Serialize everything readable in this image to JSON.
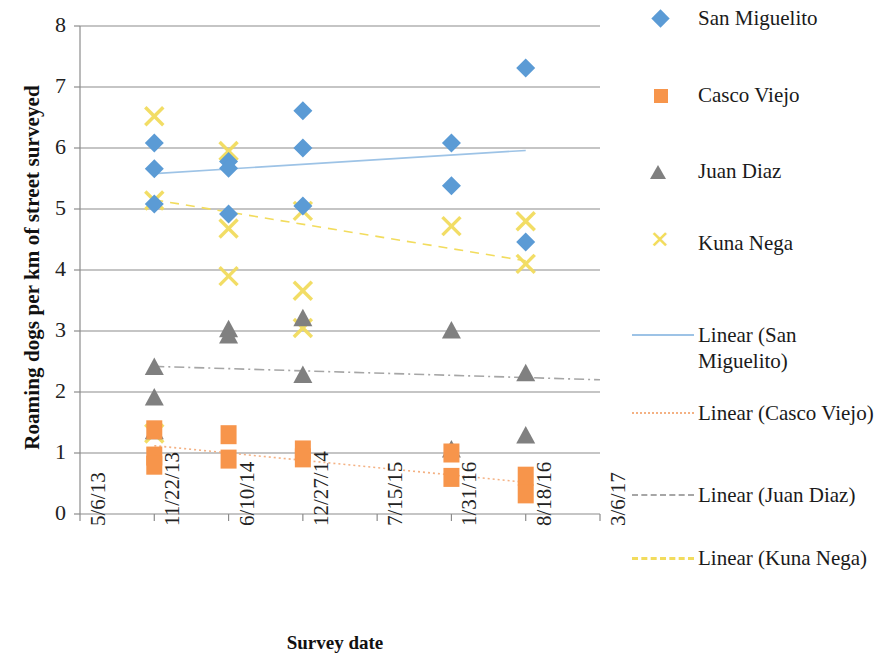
{
  "chart_data": {
    "type": "scatter",
    "title": "",
    "xlabel": "Survey date",
    "ylabel": "Roaming dogs per km of street surveyed",
    "ylim": [
      0,
      8
    ],
    "y_ticks": [
      0,
      1,
      2,
      3,
      4,
      5,
      6,
      7,
      8
    ],
    "x_ticks": [
      "5/6/13",
      "11/22/13",
      "6/10/14",
      "12/27/14",
      "7/15/15",
      "1/31/16",
      "8/18/16",
      "3/6/17"
    ],
    "grid": "horizontal",
    "legend_position": "right",
    "series": [
      {
        "name": "San Miguelito",
        "marker": "diamond",
        "color": "#5B9BD5",
        "points": [
          {
            "x": "11/22/13",
            "y": 6.08
          },
          {
            "x": "11/22/13",
            "y": 5.66
          },
          {
            "x": "11/22/13",
            "y": 5.08
          },
          {
            "x": "6/10/14",
            "y": 5.78
          },
          {
            "x": "6/10/14",
            "y": 5.67
          },
          {
            "x": "6/10/14",
            "y": 4.92
          },
          {
            "x": "12/27/14",
            "y": 6.61
          },
          {
            "x": "12/27/14",
            "y": 6.0
          },
          {
            "x": "12/27/14",
            "y": 5.05
          },
          {
            "x": "1/31/16",
            "y": 6.08
          },
          {
            "x": "1/31/16",
            "y": 5.38
          },
          {
            "x": "8/18/16",
            "y": 7.31
          },
          {
            "x": "8/18/16",
            "y": 4.46
          }
        ]
      },
      {
        "name": "Casco Viejo",
        "marker": "square",
        "color": "#F7954B",
        "points": [
          {
            "x": "11/22/13",
            "y": 1.38
          },
          {
            "x": "11/22/13",
            "y": 0.95
          },
          {
            "x": "11/22/13",
            "y": 0.8
          },
          {
            "x": "6/10/14",
            "y": 1.3
          },
          {
            "x": "6/10/14",
            "y": 0.9
          },
          {
            "x": "12/27/14",
            "y": 1.05
          },
          {
            "x": "12/27/14",
            "y": 0.92
          },
          {
            "x": "1/31/16",
            "y": 1.0
          },
          {
            "x": "1/31/16",
            "y": 0.6
          },
          {
            "x": "8/18/16",
            "y": 0.62
          },
          {
            "x": "8/18/16",
            "y": 0.33
          }
        ]
      },
      {
        "name": "Juan Diaz",
        "marker": "triangle",
        "color": "#808080",
        "points": [
          {
            "x": "11/22/13",
            "y": 2.4
          },
          {
            "x": "11/22/13",
            "y": 1.9
          },
          {
            "x": "11/22/13",
            "y": 1.35
          },
          {
            "x": "6/10/14",
            "y": 3.02
          },
          {
            "x": "6/10/14",
            "y": 2.92
          },
          {
            "x": "12/27/14",
            "y": 3.2
          },
          {
            "x": "12/27/14",
            "y": 2.27
          },
          {
            "x": "1/31/16",
            "y": 3.0
          },
          {
            "x": "1/31/16",
            "y": 1.05
          },
          {
            "x": "8/18/16",
            "y": 2.3
          },
          {
            "x": "8/18/16",
            "y": 1.28
          }
        ]
      },
      {
        "name": "Kuna Nega",
        "marker": "x",
        "color": "#F2DC5D",
        "points": [
          {
            "x": "11/22/13",
            "y": 6.52
          },
          {
            "x": "11/22/13",
            "y": 5.14
          },
          {
            "x": "11/22/13",
            "y": 1.32
          },
          {
            "x": "6/10/14",
            "y": 5.95
          },
          {
            "x": "6/10/14",
            "y": 4.68
          },
          {
            "x": "6/10/14",
            "y": 3.9
          },
          {
            "x": "12/27/14",
            "y": 4.97
          },
          {
            "x": "12/27/14",
            "y": 3.66
          },
          {
            "x": "12/27/14",
            "y": 3.05
          },
          {
            "x": "1/31/16",
            "y": 4.72
          },
          {
            "x": "8/18/16",
            "y": 4.8
          },
          {
            "x": "8/18/16",
            "y": 4.1
          }
        ]
      }
    ],
    "trendlines": [
      {
        "name": "Linear (San Miguelito)",
        "color": "#9DC3E6",
        "style": "solid",
        "x0": "11/22/13",
        "y0": 5.58,
        "x1": "8/18/16",
        "y1": 5.96
      },
      {
        "name": "Linear (Casco Viejo)",
        "color": "#F4B183",
        "style": "dotted",
        "x0": "11/22/13",
        "y0": 1.12,
        "x1": "8/18/16",
        "y1": 0.52
      },
      {
        "name": "Linear (Juan Diaz)",
        "color": "#A6A6A6",
        "style": "dashdot",
        "x0": "11/22/13",
        "y0": 2.42,
        "x1": "3/6/17",
        "y1": 2.2
      },
      {
        "name": "Linear (Kuna Nega)",
        "color": "#F2DC5D",
        "style": "dashed",
        "x0": "11/22/13",
        "y0": 5.15,
        "x1": "8/18/16",
        "y1": 4.15
      }
    ]
  },
  "axes": {
    "y_title": "Roaming dogs per km of street surveyed",
    "x_title": "Survey date",
    "y_ticks": [
      "8",
      "7",
      "6",
      "5",
      "4",
      "3",
      "2",
      "1",
      "0"
    ],
    "x_ticks": [
      "5/6/13",
      "11/22/13",
      "6/10/14",
      "12/27/14",
      "7/15/15",
      "1/31/16",
      "8/18/16",
      "3/6/17"
    ]
  },
  "legend": {
    "items": [
      {
        "label": "San Miguelito",
        "key": "diamond-marker",
        "color": "#5B9BD5"
      },
      {
        "label": "Casco Viejo",
        "key": "square-marker",
        "color": "#F7954B"
      },
      {
        "label": "Juan Diaz",
        "key": "triangle-marker",
        "color": "#808080"
      },
      {
        "label": "Kuna Nega",
        "key": "x-marker",
        "color": "#F2DC5D"
      },
      {
        "label": "Linear (San Miguelito)",
        "key": "solid-line",
        "color": "#9DC3E6"
      },
      {
        "label": "Linear (Casco Viejo)",
        "key": "dotted-line",
        "color": "#F4B183"
      },
      {
        "label": "Linear (Juan Diaz)",
        "key": "dashdot-line",
        "color": "#A6A6A6"
      },
      {
        "label": "Linear (Kuna Nega)",
        "key": "dashed-line",
        "color": "#F2DC5D"
      }
    ]
  }
}
